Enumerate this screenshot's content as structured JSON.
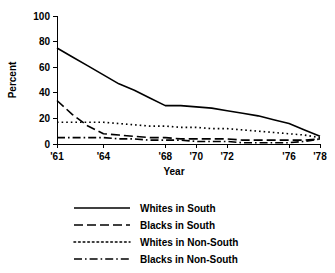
{
  "chart_data": {
    "type": "line",
    "title": "",
    "xlabel": "Year",
    "ylabel": "Percent",
    "xlim": [
      1961,
      1978
    ],
    "ylim": [
      0,
      100
    ],
    "grid": false,
    "legend_position": "bottom",
    "y_ticks": [
      0,
      20,
      40,
      60,
      80,
      100
    ],
    "y_tick_labels": [
      "0",
      "20",
      "40",
      "60",
      "80",
      "100"
    ],
    "x_ticks": [
      1961,
      1964,
      1968,
      1970,
      1972,
      1976,
      1978
    ],
    "x_tick_labels": [
      "'61",
      "'64",
      "'68",
      "'70",
      "'72",
      "'76",
      "'78"
    ],
    "x": [
      1961,
      1962,
      1963,
      1964,
      1965,
      1966,
      1967,
      1968,
      1969,
      1970,
      1971,
      1972,
      1973,
      1974,
      1975,
      1976,
      1977,
      1978
    ],
    "series": [
      {
        "name": "Whites in South",
        "style": "solid",
        "values": [
          75,
          68,
          61,
          54,
          47,
          42,
          36,
          30,
          30,
          29,
          28,
          26,
          24,
          22,
          19,
          16,
          11,
          6
        ]
      },
      {
        "name": "Blacks in South",
        "style": "dashed",
        "values": [
          34,
          23,
          14,
          8,
          7,
          6,
          5,
          5,
          4,
          4,
          4,
          4,
          3,
          3,
          3,
          3,
          3,
          4
        ]
      },
      {
        "name": "Whites in Non-South",
        "style": "dotted",
        "values": [
          17,
          17,
          17,
          17,
          16,
          15,
          14,
          14,
          13,
          13,
          12,
          12,
          11,
          10,
          9,
          8,
          7,
          5
        ]
      },
      {
        "name": "Blacks in Non-South",
        "style": "dashdot",
        "values": [
          5,
          5,
          5,
          5,
          4,
          4,
          3,
          3,
          3,
          2,
          2,
          2,
          1,
          1,
          1,
          1,
          2,
          4
        ]
      }
    ]
  },
  "legend": {
    "entries": [
      {
        "label": "Whites in South",
        "style": "solid"
      },
      {
        "label": "Blacks in South",
        "style": "dashed"
      },
      {
        "label": "Whites in Non-South",
        "style": "dotted"
      },
      {
        "label": "Blacks in Non-South",
        "style": "dashdot"
      }
    ]
  },
  "colors": {
    "ink": "#000000",
    "background": "#ffffff"
  }
}
